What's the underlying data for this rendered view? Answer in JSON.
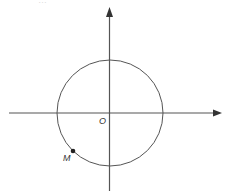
{
  "diagram": {
    "type": "unit-circle",
    "colors": {
      "stroke": "#555555",
      "point": "#222222",
      "label": "#333333"
    },
    "origin": {
      "label": "O",
      "x": 110,
      "y": 113
    },
    "circle": {
      "cx": 110,
      "cy": 113,
      "r": 53
    },
    "axes": {
      "x": {
        "from": [
          9,
          113
        ],
        "to": [
          221,
          113
        ]
      },
      "y": {
        "from": [
          109,
          191
        ],
        "to": [
          109,
          8
        ]
      }
    },
    "points": [
      {
        "label": "M",
        "x": 73,
        "y": 151
      }
    ],
    "caption_fragment": "…"
  }
}
